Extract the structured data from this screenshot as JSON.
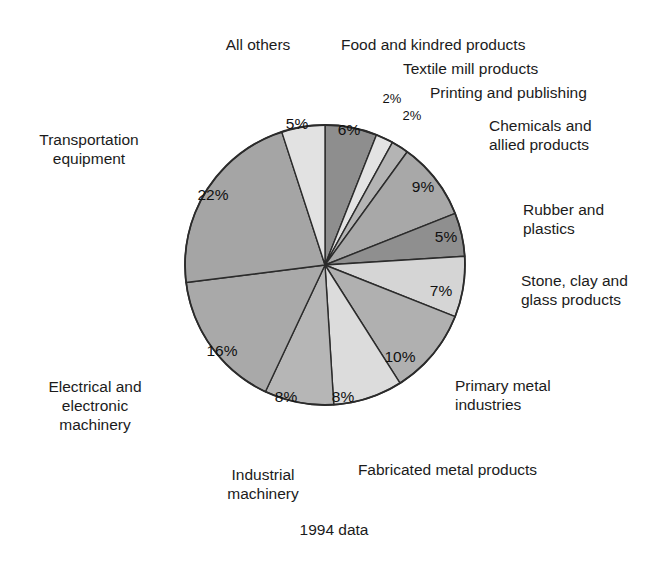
{
  "caption": "1994 data",
  "chart_data": {
    "type": "pie",
    "title": "",
    "subtitle": "",
    "xlabel": "",
    "ylabel": "",
    "legend_position": "callout-labels",
    "grid": false,
    "units": "percent",
    "start_angle_deg": 0,
    "direction": "clockwise",
    "center": {
      "cx": 325,
      "cy": 265,
      "r": 140
    },
    "categories": [
      "Food and kindred products",
      "Textile mill products",
      "Printing and publishing",
      "Chemicals and allied products",
      "Rubber and plastics",
      "Stone, clay and glass products",
      "Primary metal industries",
      "Fabricated metal products",
      "Industrial machinery",
      "Electrical and electronic machinery",
      "Transportation equipment",
      "All others"
    ],
    "values": [
      6,
      2,
      2,
      9,
      5,
      7,
      10,
      8,
      8,
      16,
      22,
      5
    ],
    "value_labels": [
      "6%",
      "2%",
      "2%",
      "9%",
      "5%",
      "7%",
      "10%",
      "8%",
      "8%",
      "16%",
      "22%",
      "5%"
    ],
    "colors": [
      "#8e8e8e",
      "#e3e3e3",
      "#b4b4b4",
      "#a8a8a8",
      "#8f8f8f",
      "#d5d5d5",
      "#b0b0b0",
      "#dcdcdc",
      "#b6b6b6",
      "#a9a9a9",
      "#a5a5a5",
      "#e2e2e2"
    ],
    "stroke": "#2b2b2b",
    "slices": [
      {
        "label": "Food and kindred products",
        "value": 6,
        "value_label": "6%",
        "color": "#8e8e8e",
        "start": 0,
        "end": 21.6,
        "label_x": 349,
        "label_y": 131
      },
      {
        "label": "Textile mill products",
        "value": 2,
        "value_label": "2%",
        "color": "#e3e3e3",
        "start": 21.6,
        "end": 28.8,
        "label_x": 392,
        "label_y": 100
      },
      {
        "label": "Printing and publishing",
        "value": 2,
        "value_label": "2%",
        "color": "#b4b4b4",
        "start": 28.8,
        "end": 36.0,
        "label_x": 412,
        "label_y": 117
      },
      {
        "label": "Chemicals and allied products",
        "value": 9,
        "value_label": "9%",
        "color": "#a8a8a8",
        "start": 36.0,
        "end": 68.4,
        "label_x": 423,
        "label_y": 188
      },
      {
        "label": "Rubber and plastics",
        "value": 5,
        "value_label": "5%",
        "color": "#8f8f8f",
        "start": 68.4,
        "end": 86.4,
        "label_x": 446,
        "label_y": 238
      },
      {
        "label": "Stone, clay and glass products",
        "value": 7,
        "value_label": "7%",
        "color": "#d5d5d5",
        "start": 86.4,
        "end": 111.6,
        "label_x": 441,
        "label_y": 292
      },
      {
        "label": "Primary metal industries",
        "value": 10,
        "value_label": "10%",
        "color": "#b0b0b0",
        "start": 111.6,
        "end": 147.6,
        "label_x": 400,
        "label_y": 358
      },
      {
        "label": "Fabricated metal products",
        "value": 8,
        "value_label": "8%",
        "color": "#dcdcdc",
        "start": 147.6,
        "end": 176.4,
        "label_x": 343,
        "label_y": 398
      },
      {
        "label": "Industrial machinery",
        "value": 8,
        "value_label": "8%",
        "color": "#b6b6b6",
        "start": 176.4,
        "end": 205.2,
        "label_x": 286,
        "label_y": 398
      },
      {
        "label": "Electrical and electronic machinery",
        "value": 16,
        "value_label": "16%",
        "color": "#a9a9a9",
        "start": 205.2,
        "end": 262.8,
        "label_x": 222,
        "label_y": 352
      },
      {
        "label": "Transportation equipment",
        "value": 22,
        "value_label": "22%",
        "color": "#a5a5a5",
        "start": 262.8,
        "end": 342.0,
        "label_x": 213,
        "label_y": 196
      },
      {
        "label": "All others",
        "value": 5,
        "value_label": "5%",
        "color": "#e2e2e2",
        "start": 342.0,
        "end": 360.0,
        "label_x": 297,
        "label_y": 125
      }
    ]
  },
  "callouts": {
    "all_others": {
      "text": "All others"
    },
    "food": {
      "text": "Food and kindred products"
    },
    "textile": {
      "text": "Textile mill products"
    },
    "printing": {
      "text": "Printing and publishing"
    },
    "chemicals": {
      "text": "Chemicals and\nallied products"
    },
    "rubber": {
      "text": "Rubber and\nplastics"
    },
    "stone": {
      "text": "Stone, clay and\nglass products"
    },
    "primary_metal": {
      "text": "Primary metal\nindustries"
    },
    "fabricated_metal": {
      "text": "Fabricated metal products"
    },
    "industrial": {
      "text": "Industrial\nmachinery"
    },
    "electrical": {
      "text": "Electrical and\nelectronic\nmachinery"
    },
    "transportation": {
      "text": "Transportation\nequipment"
    }
  }
}
